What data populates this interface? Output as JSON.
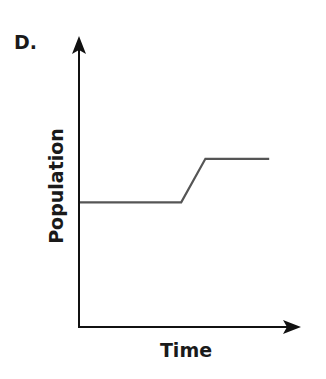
{
  "panel": {
    "label": "D."
  },
  "colors": {
    "axis": "#111111",
    "line": "#555555",
    "background": "#ffffff"
  },
  "chart_data": {
    "type": "line",
    "title": "",
    "panel_label": "D.",
    "xlabel": "Time",
    "ylabel": "Population",
    "xlim": [
      0,
      10
    ],
    "ylim": [
      0,
      10
    ],
    "grid": false,
    "legend": null,
    "ticks": {
      "x": [],
      "y": []
    },
    "series": [
      {
        "name": "Population",
        "x": [
          0,
          4.6,
          5.7,
          8.6
        ],
        "y": [
          4.3,
          4.3,
          5.8,
          5.8
        ]
      }
    ]
  }
}
